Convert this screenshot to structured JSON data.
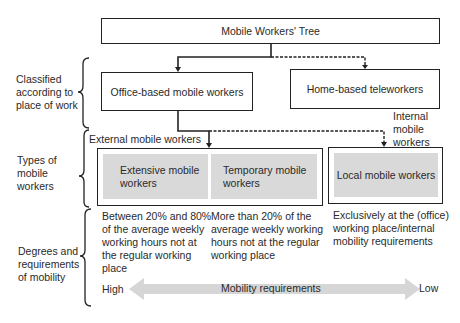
{
  "title": "Mobile Workers' Tree",
  "left_labels": [
    {
      "lines": [
        "Classified",
        "according to",
        "place of work"
      ]
    },
    {
      "lines": [
        "Types of",
        "mobile",
        "workers"
      ]
    },
    {
      "lines": [
        "Degrees and",
        "requirements",
        "of mobility"
      ]
    }
  ],
  "level1": {
    "office": "Office-based mobile workers",
    "home": "Home-based teleworkers"
  },
  "group_labels": {
    "external": "External mobile workers",
    "internal": [
      "Internal",
      "mobile",
      "workers"
    ]
  },
  "types": {
    "extensive": [
      "Extensive mobile",
      "workers"
    ],
    "temporary": [
      "Temporary mobile",
      "workers"
    ],
    "local": "Local mobile workers"
  },
  "descriptions": {
    "extensive": [
      "Between 20% and 80%",
      "of the average weekly",
      "working hours not at",
      "the regular working",
      "place"
    ],
    "temporary": [
      "More than 20% of the",
      "average weekly working",
      "hours not at the regular",
      "working place"
    ],
    "local": [
      "Exclusively at the (office)",
      "working place/internal",
      "mobility requirements"
    ]
  },
  "scale": {
    "high": "High",
    "label": "Mobility requirements",
    "low": "Low"
  },
  "colors": {
    "line": "#222222",
    "grey_fill": "#d9d9d9",
    "arrow_fill": "#d6d6d6"
  }
}
